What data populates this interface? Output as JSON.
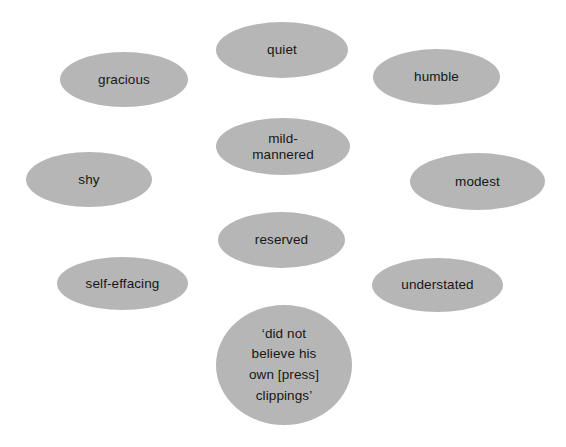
{
  "diagram": {
    "title": "",
    "background_color": "#ffffff",
    "bubble_fill_color": "#b6b6b6",
    "bubble_text_color": "#161616",
    "bubbles": [
      {
        "name": "bubble-quiet",
        "label": "quiet",
        "x": 216,
        "y": 22,
        "w": 132,
        "h": 56
      },
      {
        "name": "bubble-gracious",
        "label": "gracious",
        "x": 60,
        "y": 52,
        "w": 128,
        "h": 55
      },
      {
        "name": "bubble-humble",
        "label": "humble",
        "x": 373,
        "y": 49,
        "w": 127,
        "h": 56
      },
      {
        "name": "bubble-mild-mannered",
        "label": "mild-\nmannered",
        "x": 216,
        "y": 118,
        "w": 134,
        "h": 57
      },
      {
        "name": "bubble-shy",
        "label": "shy",
        "x": 26,
        "y": 152,
        "w": 126,
        "h": 55
      },
      {
        "name": "bubble-modest",
        "label": "modest",
        "x": 410,
        "y": 153,
        "w": 135,
        "h": 57
      },
      {
        "name": "bubble-reserved",
        "label": "reserved",
        "x": 218,
        "y": 212,
        "w": 127,
        "h": 56
      },
      {
        "name": "bubble-self-effacing",
        "label": "self-effacing",
        "x": 57,
        "y": 257,
        "w": 131,
        "h": 53
      },
      {
        "name": "bubble-understated",
        "label": "understated",
        "x": 372,
        "y": 258,
        "w": 131,
        "h": 54
      },
      {
        "name": "bubble-press-clippings-quote",
        "label": "‘did not\nbelieve his\nown [press]\nclippings’",
        "x": 216,
        "y": 305,
        "w": 136,
        "h": 120,
        "quote": true
      }
    ]
  }
}
